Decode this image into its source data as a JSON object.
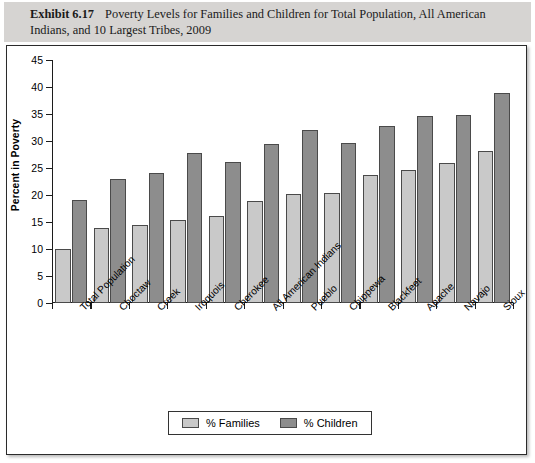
{
  "exhibit": {
    "label": "Exhibit 6.17",
    "caption": "Poverty Levels for Families and Children for Total Population, All American Indians, and 10 Largest Tribes, 2009"
  },
  "legend": {
    "families_label": "% Families",
    "children_label": "% Children",
    "families_color": "#c9c9c9",
    "children_color": "#8d8d8d"
  },
  "chart_data": {
    "type": "bar",
    "title": "Poverty Levels for Families and Children for Total Population, All American Indians, and 10 Largest Tribes, 2009",
    "xlabel": "",
    "ylabel": "Percent in Poverty",
    "ylim": [
      0,
      45
    ],
    "yticks": [
      0,
      5,
      10,
      15,
      20,
      25,
      30,
      35,
      40,
      45
    ],
    "grid": false,
    "legend_position": "bottom",
    "categories": [
      "Total Population",
      "Choctaw",
      "Creek",
      "Iroquois",
      "Cherokee",
      "All American Indians",
      "Pueblo",
      "Chippewa",
      "Blackfeet",
      "Apache",
      "Navajo",
      "Sioux"
    ],
    "series": [
      {
        "name": "% Families",
        "color": "#c9c9c9",
        "values": [
          10.0,
          13.9,
          14.4,
          15.3,
          16.1,
          18.9,
          20.2,
          20.3,
          23.7,
          24.7,
          26.0,
          28.1
        ]
      },
      {
        "name": "% Children",
        "color": "#8d8d8d",
        "values": [
          19.0,
          23.0,
          24.0,
          27.8,
          26.1,
          29.4,
          32.0,
          29.6,
          32.8,
          34.6,
          34.9,
          38.9
        ]
      }
    ]
  }
}
